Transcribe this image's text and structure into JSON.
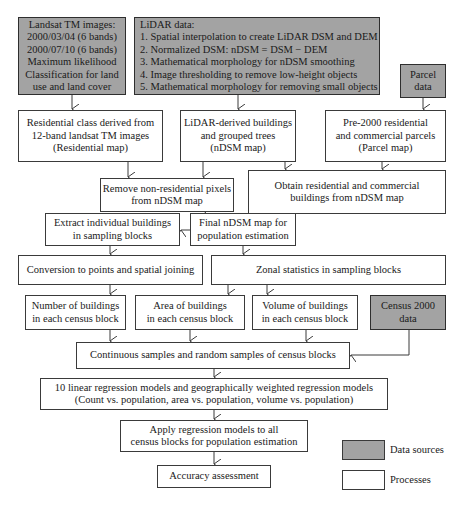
{
  "colors": {
    "data_source_fill": "#a3a3a3",
    "process_fill": "#ffffff",
    "border": "#3a3a3a"
  },
  "nodes": {
    "landsat": {
      "type": "data",
      "lines": [
        "Landsat TM images:",
        "2000/03/04 (6 bands)",
        "2000/07/10 (6 bands)",
        "Maximum likelihood",
        "Classification for land",
        "use and land cover"
      ]
    },
    "lidar": {
      "type": "data",
      "lines": [
        "LiDAR data:",
        "1. Spatial interpolation to create LiDAR DSM and DEM",
        "2. Normalized DSM: nDSM = DSM − DEM",
        "3. Mathematical morphology for nDSM smoothing",
        "4. Image thresholding to remove low-height objects",
        "5. Mathematical morphology for removing small objects"
      ]
    },
    "parcel_data": {
      "type": "data",
      "lines": [
        "Parcel",
        "data"
      ]
    },
    "residential_class": {
      "type": "process",
      "lines": [
        "Residential class derived from",
        "12-band landsat TM images",
        "(Residential map)"
      ]
    },
    "lidar_derived": {
      "type": "process",
      "lines": [
        "LiDAR-derived buildings",
        "and grouped trees",
        "(nDSM map)"
      ]
    },
    "pre2000": {
      "type": "process",
      "lines": [
        "Pre-2000 residential",
        "and commercial parcels",
        "(Parcel map)"
      ]
    },
    "remove_nonres": {
      "type": "process",
      "lines": [
        "Remove non-residential pixels",
        "from nDSM map"
      ]
    },
    "obtain_res": {
      "type": "process",
      "lines": [
        "Obtain residential and commercial",
        "buildings from nDSM map"
      ]
    },
    "extract": {
      "type": "process",
      "lines": [
        "Extract individual buildings",
        "in sampling blocks"
      ]
    },
    "final_ndsm": {
      "type": "process",
      "lines": [
        "Final nDSM map for",
        "population estimation"
      ]
    },
    "conversion": {
      "type": "process",
      "lines": [
        "Conversion to points and spatial joining"
      ]
    },
    "zonal": {
      "type": "process",
      "lines": [
        "Zonal statistics in sampling blocks"
      ]
    },
    "number": {
      "type": "process",
      "lines": [
        "Number of buildings",
        "in each census block"
      ]
    },
    "area": {
      "type": "process",
      "lines": [
        "Area of buildings",
        "in each census block"
      ]
    },
    "volume": {
      "type": "process",
      "lines": [
        "Volume of buildings",
        "in each census block"
      ]
    },
    "census": {
      "type": "data",
      "lines": [
        "Census 2000",
        "data"
      ]
    },
    "continuous": {
      "type": "process",
      "lines": [
        "Continuous samples and random samples of census blocks"
      ]
    },
    "regression": {
      "type": "process",
      "lines": [
        "10 linear regression models and geographically weighted regression models",
        "(Count vs. population, area vs. population, volume vs. population)"
      ]
    },
    "apply": {
      "type": "process",
      "lines": [
        "Apply regression models to all",
        "census blocks for population estimation"
      ]
    },
    "accuracy": {
      "type": "process",
      "lines": [
        "Accuracy assessment"
      ]
    }
  },
  "legend": {
    "data_sources": "Data sources",
    "processes": "Processes"
  }
}
